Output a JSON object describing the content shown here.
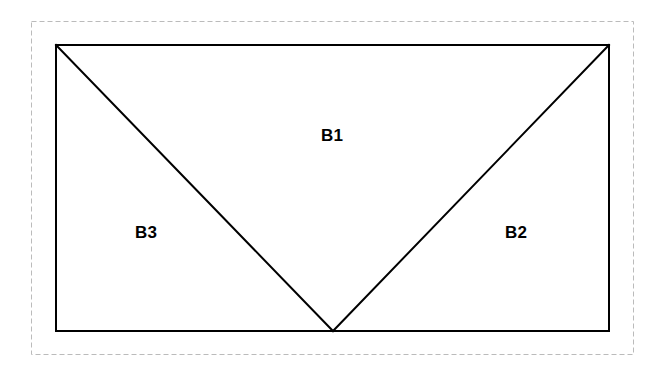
{
  "figure": {
    "title": "",
    "canvas": {
      "width": 662,
      "height": 377,
      "background": "#ffffff"
    },
    "outer_boundary": {
      "name": "dashed-bounding-box",
      "style": "dashed",
      "color": "#bbbbbb",
      "stroke_width": 1,
      "dash": "5 3",
      "x": 31,
      "y": 21,
      "width": 602,
      "height": 333
    },
    "outer_rectangle": {
      "name": "solid-rectangle",
      "style": "solid",
      "color": "#000000",
      "stroke_width": 2,
      "x": 55,
      "y": 44,
      "width": 554,
      "height": 287
    },
    "vertex": {
      "label": "apex",
      "x": 333,
      "y": 331
    },
    "diagonals": [
      {
        "name": "left-diagonal",
        "from": [
          55,
          44
        ],
        "to": [
          333,
          331
        ],
        "color": "#000000",
        "stroke_width": 2
      },
      {
        "name": "right-diagonal",
        "from": [
          333,
          331
        ],
        "to": [
          609,
          44
        ],
        "color": "#000000",
        "stroke_width": 2
      }
    ],
    "labels": [
      {
        "id": "b1",
        "text": "B1",
        "x": 332,
        "y": 135
      },
      {
        "id": "b3",
        "text": "B3",
        "x": 146,
        "y": 232
      },
      {
        "id": "b2",
        "text": "B2",
        "x": 516,
        "y": 232
      }
    ]
  }
}
